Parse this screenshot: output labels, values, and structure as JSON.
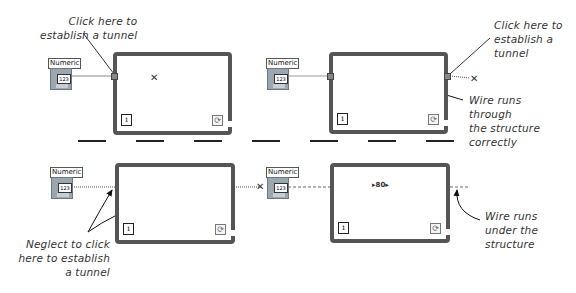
{
  "panels": [
    {
      "id": "top-left",
      "control_label": "Numeric",
      "control_value": "123",
      "annotation": "Click here to\nestablish a tunnel"
    },
    {
      "id": "top-right",
      "control_label": "Numeric",
      "control_value": "123",
      "annotations": [
        "Click here to\nestablish a\ntunnel",
        "Wire runs\nthrough\nthe structure\ncorrectly"
      ]
    },
    {
      "id": "bottom-left",
      "control_label": "Numeric",
      "control_value": "123",
      "annotation": "Neglect to click\nhere to establish\na tunnel"
    },
    {
      "id": "bottom-right",
      "control_label": "Numeric",
      "control_value": "123",
      "annotation": "Wire runs\nunder the\nstructure"
    }
  ],
  "icons": {
    "iteration_terminal": "i",
    "conditional_terminal": "⟳",
    "broken_wire": "✕"
  }
}
